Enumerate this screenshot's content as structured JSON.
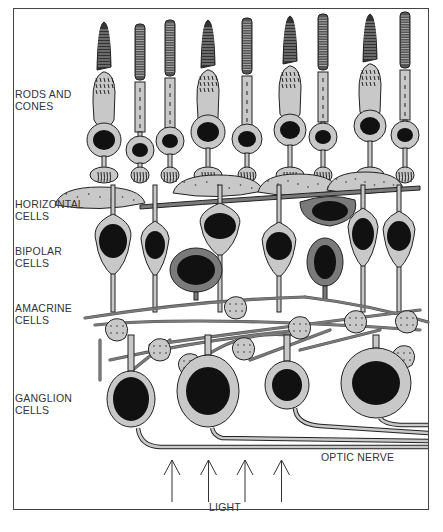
{
  "diagram": {
    "labels": {
      "rods_and_cones": [
        "RODS AND",
        "CONES"
      ],
      "horizontal_cells": [
        "HORIZONTAL",
        "CELLS"
      ],
      "bipolar_cells": [
        "BIPOLAR",
        "CELLS"
      ],
      "amacrine_cells": [
        "AMACRINE",
        "CELLS"
      ],
      "ganglion_cells": [
        "GANGLION",
        "CELLS"
      ],
      "optic_nerve": "OPTIC NERVE",
      "light": "LIGHT"
    },
    "light_arrow_count": 4,
    "colors": {
      "cell_fill": "#c8c8c8",
      "dark_cell_fill": "#7a7a7a",
      "nucleus": "#111111",
      "outline": "#222222",
      "background": "#ffffff"
    },
    "caption": "(partially cropped caption)"
  }
}
